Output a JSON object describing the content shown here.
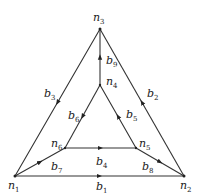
{
  "diagram": {
    "nodes": [
      {
        "id": "n1",
        "label": "n",
        "sub": "1"
      },
      {
        "id": "n2",
        "label": "n",
        "sub": "2"
      },
      {
        "id": "n3",
        "label": "n",
        "sub": "3"
      },
      {
        "id": "n4",
        "label": "n",
        "sub": "4"
      },
      {
        "id": "n5",
        "label": "n",
        "sub": "5"
      },
      {
        "id": "n6",
        "label": "n",
        "sub": "6"
      }
    ],
    "branches": [
      {
        "id": "b1",
        "label": "b",
        "sub": "1",
        "from": "n1",
        "to": "n2"
      },
      {
        "id": "b2",
        "label": "b",
        "sub": "2",
        "from": "n2",
        "to": "n3"
      },
      {
        "id": "b3",
        "label": "b",
        "sub": "3",
        "from": "n3",
        "to": "n1"
      },
      {
        "id": "b4",
        "label": "b",
        "sub": "4",
        "from": "n6",
        "to": "n5"
      },
      {
        "id": "b5",
        "label": "b",
        "sub": "5",
        "from": "n5",
        "to": "n4"
      },
      {
        "id": "b6",
        "label": "b",
        "sub": "6",
        "from": "n4",
        "to": "n6"
      },
      {
        "id": "b7",
        "label": "b",
        "sub": "7",
        "from": "n1",
        "to": "n6"
      },
      {
        "id": "b8",
        "label": "b",
        "sub": "8",
        "from": "n5",
        "to": "n2"
      },
      {
        "id": "b9",
        "label": "b",
        "sub": "9",
        "from": "n4",
        "to": "n3"
      }
    ]
  }
}
